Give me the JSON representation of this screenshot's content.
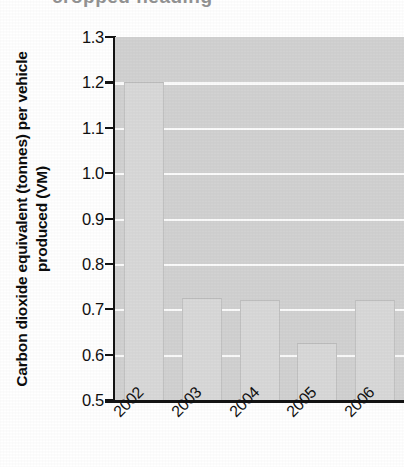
{
  "title_sliver": {
    "text": "cropped heading",
    "legible": false
  },
  "chart_data": {
    "type": "bar",
    "title": "",
    "xlabel": "",
    "ylabel": "Carbon dioxide equivalent (tonnes) per vehicle produced (VM)",
    "categories": [
      "2002",
      "2003",
      "2004",
      "2005",
      "2006"
    ],
    "values": [
      1.2,
      0.725,
      0.72,
      0.625,
      0.72
    ],
    "ylim": [
      0.5,
      1.3
    ],
    "ytick_step": 0.1,
    "yticks": [
      "1.3",
      "1.2",
      "1.1",
      "1.0",
      "0.9",
      "0.8",
      "0.7",
      "0.6",
      "0.5"
    ],
    "ytick_values": [
      1.3,
      1.2,
      1.1,
      1.0,
      0.9,
      0.8,
      0.7,
      0.6,
      0.5
    ],
    "gridlines": [
      1.2,
      1.1,
      1.0,
      0.9,
      0.8,
      0.7,
      0.6
    ],
    "grid": true,
    "legend": false,
    "legend_position": "none",
    "xtick_rotation_deg": -45,
    "colors": {
      "plot_background": "#d2d2d2",
      "bar_fill": "#d9d9d9",
      "bar_outline": "#c2c2c2",
      "gridline": "#fbfbfb",
      "axis": "#141414",
      "text": "#111111"
    }
  }
}
